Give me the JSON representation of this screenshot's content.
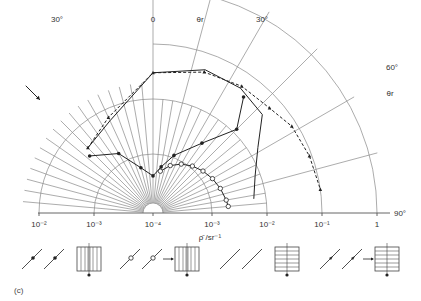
{
  "chart_data": {
    "type": "polar-line",
    "title": "",
    "panel_label": "(c)",
    "xlabel": "ρ̄ /sr⁻¹",
    "radial_scale": "log",
    "radial_ticks_left": [
      "10⁻²",
      "10⁻³"
    ],
    "radial_ticks_center": "10⁻⁴",
    "radial_ticks_right": [
      "10⁻³",
      "10⁻²",
      "10⁻¹",
      "1"
    ],
    "angle_labels": [
      {
        "text": "30°",
        "side": "left",
        "angle": -30
      },
      {
        "text": "0",
        "side": "top",
        "angle": 0
      },
      {
        "text": "θr",
        "side": "top",
        "angle": 13
      },
      {
        "text": "30°",
        "side": "right",
        "angle": 30
      },
      {
        "text": "60°",
        "side": "right",
        "angle": 60
      },
      {
        "text": "θr",
        "side": "right",
        "angle": 68
      },
      {
        "text": "90°",
        "side": "right",
        "angle": 90
      }
    ],
    "incident_angle_deg": -45,
    "series": [
      {
        "name": "filled-circle vertical pattern",
        "style": "solid",
        "marker": "filled-circle",
        "points": [
          [
            -48,
            0.003
          ],
          [
            -30,
            0.0015
          ],
          [
            -15,
            0.0006
          ],
          [
            0,
            0.0004
          ],
          [
            10,
            0.0006
          ],
          [
            20,
            0.0011
          ],
          [
            35,
            0.003
          ],
          [
            45,
            0.012
          ],
          [
            38,
            0.04
          ]
        ]
      },
      {
        "name": "open-circle vertical pattern",
        "style": "solid",
        "marker": "open-circle",
        "points": [
          [
            10,
            0.0005
          ],
          [
            20,
            0.0007
          ],
          [
            30,
            0.0009
          ],
          [
            40,
            0.0011
          ],
          [
            50,
            0.0013
          ],
          [
            60,
            0.0015
          ],
          [
            70,
            0.0017
          ],
          [
            80,
            0.0019
          ],
          [
            85,
            0.002
          ]
        ]
      },
      {
        "name": "plain horizontal pattern",
        "style": "solid",
        "marker": "none",
        "points": [
          [
            -45,
            0.004
          ],
          [
            -25,
            0.006
          ],
          [
            0,
            0.03
          ],
          [
            20,
            0.05
          ],
          [
            35,
            0.05
          ],
          [
            48,
            0.04
          ],
          [
            58,
            0.015
          ],
          [
            70,
            0.008
          ],
          [
            82,
            0.006
          ]
        ]
      },
      {
        "name": "arrow horizontal pattern",
        "style": "dashed",
        "marker": "arrow",
        "points": [
          [
            -45,
            0.004
          ],
          [
            -25,
            0.007
          ],
          [
            0,
            0.03
          ],
          [
            20,
            0.045
          ],
          [
            35,
            0.055
          ],
          [
            48,
            0.06
          ],
          [
            58,
            0.08
          ],
          [
            70,
            0.09
          ],
          [
            82,
            0.1
          ]
        ]
      }
    ]
  },
  "legend": [
    {
      "id": "filled",
      "beam_marker": "filled-circle",
      "grating": "vertical",
      "arrow": false
    },
    {
      "id": "open",
      "beam_marker": "open-circle",
      "grating": "vertical",
      "arrow": true
    },
    {
      "id": "plain",
      "beam_marker": "none",
      "grating": "horizontal",
      "arrow": false
    },
    {
      "id": "arrow",
      "beam_marker": "arrow",
      "grating": "horizontal",
      "arrow": true
    }
  ]
}
